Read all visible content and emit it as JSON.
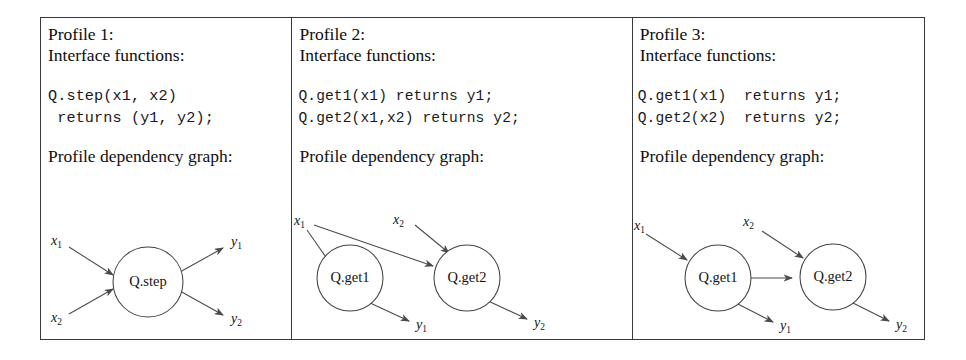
{
  "figure": {
    "panels": [
      {
        "title": "Profile 1:",
        "interface_heading": "Interface functions:",
        "code": "Q.step(x1, x2)\n returns (y1, y2);",
        "graph_heading": "Profile dependency graph:",
        "graph": {
          "nodes": [
            {
              "id": "step",
              "label": "Q.step"
            }
          ],
          "inputs": [
            {
              "base": "x",
              "sub": "1"
            },
            {
              "base": "x",
              "sub": "2"
            }
          ],
          "outputs": [
            {
              "base": "y",
              "sub": "1"
            },
            {
              "base": "y",
              "sub": "2"
            }
          ]
        }
      },
      {
        "title": "Profile 2:",
        "interface_heading": "Interface functions:",
        "code": "Q.get1(x1) returns y1;\nQ.get2(x1,x2) returns y2;",
        "graph_heading": "Profile dependency graph:",
        "graph": {
          "nodes": [
            {
              "id": "get1",
              "label": "Q.get1"
            },
            {
              "id": "get2",
              "label": "Q.get2"
            }
          ],
          "inputs": [
            {
              "base": "x",
              "sub": "1"
            },
            {
              "base": "x",
              "sub": "2"
            }
          ],
          "outputs": [
            {
              "base": "y",
              "sub": "1"
            },
            {
              "base": "y",
              "sub": "2"
            }
          ]
        }
      },
      {
        "title": "Profile 3:",
        "interface_heading": "Interface functions:",
        "code": "Q.get1(x1)  returns y1;\nQ.get2(x2)  returns y2;",
        "graph_heading": "Profile dependency graph:",
        "graph": {
          "nodes": [
            {
              "id": "get1",
              "label": "Q.get1"
            },
            {
              "id": "get2",
              "label": "Q.get2"
            }
          ],
          "inputs": [
            {
              "base": "x",
              "sub": "1"
            },
            {
              "base": "x",
              "sub": "2"
            }
          ],
          "outputs": [
            {
              "base": "y",
              "sub": "1"
            },
            {
              "base": "y",
              "sub": "2"
            }
          ]
        }
      }
    ]
  },
  "colors": {
    "border": "#3a3a3a",
    "stroke": "#4a4a4a",
    "text": "#111111",
    "background": "#ffffff"
  }
}
